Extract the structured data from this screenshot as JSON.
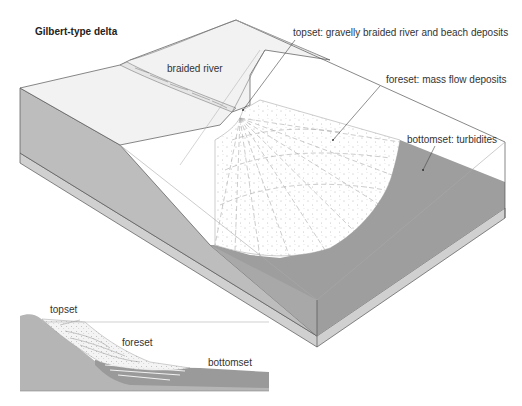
{
  "title": "Gilbert-type delta",
  "block_diagram": {
    "labels": {
      "braided_river": "braided river",
      "topset": "topset: gravelly braided river and beach deposits",
      "foreset": "foreset: mass flow deposits",
      "bottomset": "bottomset: turbidites"
    }
  },
  "cross_section": {
    "labels": {
      "topset": "topset",
      "foreset": "foreset",
      "bottomset": "bottomset"
    }
  },
  "colors": {
    "land_surface": "#f2f2f2",
    "side_face": "#bdbdbd",
    "bottomset_fill": "#9e9e9e",
    "base_strip": "#d0d0d0",
    "outline": "#555555",
    "water_lines": "#aaaaaa"
  }
}
